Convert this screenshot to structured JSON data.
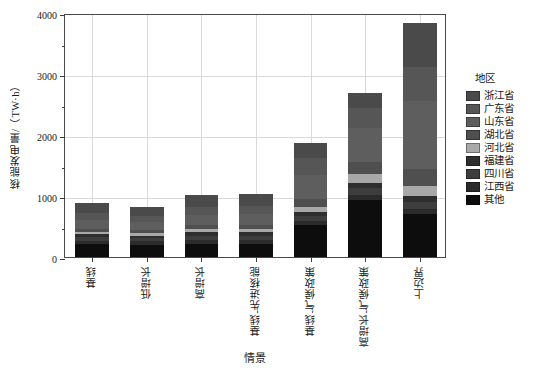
{
  "chart_data": {
    "type": "bar",
    "stacked": true,
    "title": "",
    "xlabel": "情景",
    "ylabel": "核能发电量/（TW·h）",
    "ylim": [
      0,
      4000
    ],
    "yticks": [
      0,
      1000,
      2000,
      3000,
      4000
    ],
    "ytick_labels": [
      "0",
      "1000",
      "2000",
      "3000",
      "4000"
    ],
    "yminor_ticks": [
      500,
      1500,
      2500,
      3500
    ],
    "grid": true,
    "legend_title": "地区",
    "legend_position": "right",
    "categories": [
      "基线",
      "低增长",
      "高增长",
      "基线-先进核能",
      "基线-气候政策",
      "高增长-气候政策",
      "上边界"
    ],
    "series": [
      {
        "name": "其他",
        "color": "#0d0d0d",
        "values": [
          210,
          200,
          215,
          215,
          520,
          930,
          700
        ]
      },
      {
        "name": "江西省",
        "color": "#2b2b2b",
        "values": [
          60,
          55,
          70,
          70,
          75,
          95,
          95
        ]
      },
      {
        "name": "四川省",
        "color": "#3d3d3d",
        "values": [
          55,
          50,
          65,
          65,
          80,
          100,
          105
        ]
      },
      {
        "name": "福建省",
        "color": "#2e2e2e",
        "values": [
          45,
          45,
          55,
          55,
          65,
          85,
          95
        ]
      },
      {
        "name": "河北省",
        "color": "#a8a8a8",
        "values": [
          40,
          40,
          50,
          50,
          75,
          150,
          175
        ]
      },
      {
        "name": "湖北省",
        "color": "#4f4f4f",
        "values": [
          55,
          50,
          65,
          65,
          130,
          200,
          280
        ]
      },
      {
        "name": "山东省",
        "color": "#5e5e5e",
        "values": [
          150,
          140,
          175,
          180,
          400,
          560,
          1110
        ]
      },
      {
        "name": "广东省",
        "color": "#565656",
        "values": [
          110,
          100,
          130,
          135,
          280,
          320,
          560
        ]
      },
      {
        "name": "浙江省",
        "color": "#4a4a4a",
        "values": [
          155,
          140,
          185,
          195,
          245,
          245,
          710
        ]
      }
    ],
    "totals": [
      880,
      820,
      1010,
      1030,
      1870,
      2685,
      3830
    ]
  },
  "legend": {
    "title": "地区",
    "items": [
      {
        "label": "浙江省",
        "color": "#4a4a4a"
      },
      {
        "label": "广东省",
        "color": "#565656"
      },
      {
        "label": "山东省",
        "color": "#5e5e5e"
      },
      {
        "label": "湖北省",
        "color": "#4f4f4f"
      },
      {
        "label": "河北省",
        "color": "#a8a8a8"
      },
      {
        "label": "福建省",
        "color": "#2e2e2e"
      },
      {
        "label": "四川省",
        "color": "#3d3d3d"
      },
      {
        "label": "江西省",
        "color": "#2b2b2b"
      },
      {
        "label": "其他",
        "color": "#0d0d0d"
      }
    ]
  },
  "axes": {
    "y_title": "核能发电量/（TW·h）",
    "x_title": "情景"
  },
  "colors": {
    "axis": "#4a4a4a",
    "grid": "#d9d9d9",
    "background": "#ffffff",
    "text": "#1a1a1a"
  }
}
